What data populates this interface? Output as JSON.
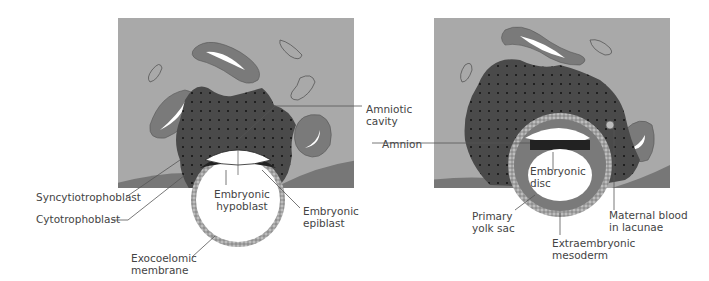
{
  "colors": {
    "tissue": "#a9a9a9",
    "uterine_wall": "#777777",
    "vessel": "#7a7a7a",
    "trophoblast": "#4a4a4a",
    "cavity": "#ffffff",
    "epiblast": "#222222",
    "leader": "#555555",
    "text": "#444444"
  },
  "left_panel": {
    "labels": {
      "amniotic_cavity": [
        "Amniotic",
        "cavity"
      ],
      "syncytiotrophoblast": "Syncytiotrophoblast",
      "cytotrophoblast": "Cytotrophoblast",
      "embryonic_hypoblast": [
        "Embryonic",
        "hypoblast"
      ],
      "embryonic_epiblast": [
        "Embryonic",
        "epiblast"
      ],
      "exocoelomic_membrane": [
        "Exocoelomic",
        "membrane"
      ]
    }
  },
  "right_panel": {
    "labels": {
      "amnion": "Amnion",
      "embryonic_disc": [
        "Embryonic",
        "disc"
      ],
      "primary_yolk_sac": [
        "Primary",
        "yolk sac"
      ],
      "extraembryonic_mesoderm": [
        "Extraembryonic",
        "mesoderm"
      ],
      "maternal_blood": [
        "Maternal blood",
        "in lacunae"
      ]
    }
  }
}
